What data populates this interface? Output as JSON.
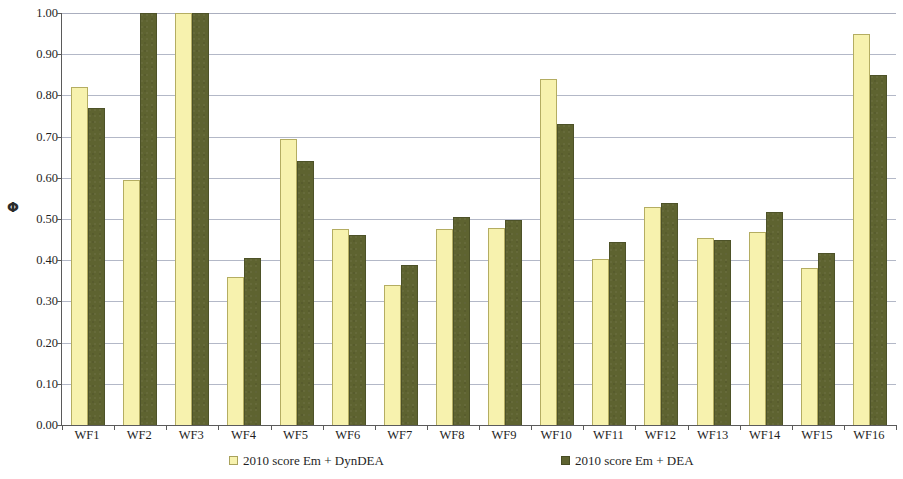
{
  "chart_data": {
    "type": "bar",
    "title": "",
    "xlabel": "",
    "ylabel": "Φ",
    "ylim": [
      0,
      1.0
    ],
    "ytick_step": 0.1,
    "ytick_labels": [
      "1.00",
      "0.90",
      "0.80",
      "0.70",
      "0.60",
      "0.50",
      "0.40",
      "0.30",
      "0.20",
      "0.10",
      "0.00"
    ],
    "ytick_values": [
      1.0,
      0.9,
      0.8,
      0.7,
      0.6,
      0.5,
      0.4,
      0.3,
      0.2,
      0.1,
      0.0
    ],
    "grid": true,
    "legend_position": "bottom",
    "categories": [
      "WF1",
      "WF2",
      "WF3",
      "WF4",
      "WF5",
      "WF6",
      "WF7",
      "WF8",
      "WF9",
      "WF10",
      "WF11",
      "WF12",
      "WF13",
      "WF14",
      "WF15",
      "WF16"
    ],
    "series": [
      {
        "name": "2010 score Em + DynDEA",
        "color": "#f7f2ae",
        "values": [
          0.82,
          0.595,
          1.0,
          0.36,
          0.695,
          0.475,
          0.34,
          0.475,
          0.478,
          0.84,
          0.402,
          0.528,
          0.453,
          0.468,
          0.382,
          0.95
        ]
      },
      {
        "name": "2010 score Em + DEA",
        "color": "#5e6330",
        "values": [
          0.77,
          1.0,
          1.0,
          0.405,
          0.64,
          0.462,
          0.388,
          0.505,
          0.498,
          0.73,
          0.445,
          0.54,
          0.448,
          0.518,
          0.418,
          0.85
        ]
      }
    ]
  },
  "legend": {
    "entries": [
      {
        "label": "2010 score Em + DynDEA"
      },
      {
        "label": "2010 score Em + DEA"
      }
    ]
  }
}
